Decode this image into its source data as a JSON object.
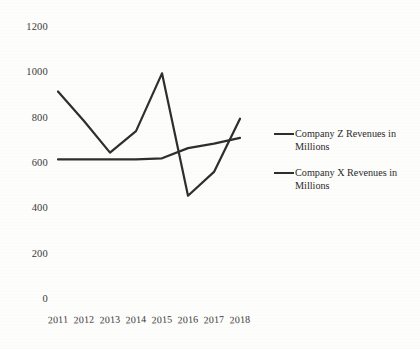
{
  "chart_data": {
    "type": "line",
    "title": "",
    "xlabel": "",
    "ylabel": "",
    "categories": [
      "2011",
      "2012",
      "2013",
      "2014",
      "2015",
      "2016",
      "2017",
      "2018"
    ],
    "ylim": [
      0,
      1200
    ],
    "yticks": [
      "0",
      "200",
      "400",
      "600",
      "800",
      "1000",
      "1200"
    ],
    "ytick_values": [
      0,
      200,
      400,
      600,
      800,
      1000,
      1200
    ],
    "grid": false,
    "legend_position": "right",
    "series": [
      {
        "name": "Company Z Revenues in Millions",
        "color": "#2e2e2e",
        "values": [
          920,
          790,
          650,
          745,
          1000,
          460,
          565,
          800
        ]
      },
      {
        "name": "Company X Revenues in Millions",
        "color": "#2e2e2e",
        "values": [
          620,
          620,
          620,
          620,
          625,
          670,
          690,
          715
        ]
      }
    ]
  },
  "legend": {
    "items": [
      {
        "label": "Company Z Revenues in Millions"
      },
      {
        "label": "Company X Revenues in Millions"
      }
    ]
  }
}
